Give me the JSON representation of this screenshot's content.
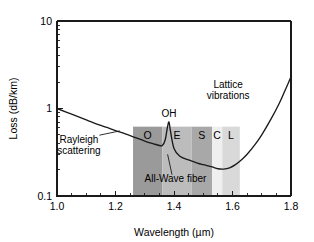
{
  "figure": {
    "background_color": "#ffffff",
    "axis_color": "#1a1a1a",
    "curve_color": "#1a1a1a"
  },
  "chart_data": {
    "type": "line",
    "title": "",
    "xlabel": "Wavelength (µm)",
    "ylabel": "Loss (dB/km)",
    "xlim": [
      1.0,
      1.8
    ],
    "ylim": [
      0.1,
      10
    ],
    "yscale": "log",
    "xscale": "linear",
    "grid": false,
    "legend": "none",
    "x_ticks": [
      {
        "value": 1.0,
        "label": "1.0"
      },
      {
        "value": 1.2,
        "label": "1.2"
      },
      {
        "value": 1.4,
        "label": "1.4"
      },
      {
        "value": 1.6,
        "label": "1.6"
      },
      {
        "value": 1.8,
        "label": "1.8"
      }
    ],
    "x_minor_ticks": [
      1.05,
      1.1,
      1.15,
      1.25,
      1.3,
      1.35,
      1.45,
      1.5,
      1.55,
      1.65,
      1.7,
      1.75
    ],
    "y_ticks": [
      {
        "value": 10,
        "label": "10"
      },
      {
        "value": 1,
        "label": "1"
      },
      {
        "value": 0.1,
        "label": "0.1"
      }
    ],
    "y_minor_ticks": [
      0.2,
      0.3,
      0.4,
      0.5,
      0.6,
      0.7,
      0.8,
      0.9,
      2,
      3,
      4,
      5,
      6,
      7,
      8,
      9
    ],
    "series": [
      {
        "name": "Fiber attenuation",
        "points": [
          [
            1.0,
            1.0
          ],
          [
            1.05,
            0.86
          ],
          [
            1.1,
            0.74
          ],
          [
            1.15,
            0.64
          ],
          [
            1.2,
            0.56
          ],
          [
            1.25,
            0.49
          ],
          [
            1.3,
            0.425
          ],
          [
            1.33,
            0.395
          ],
          [
            1.35,
            0.378
          ],
          [
            1.36,
            0.378
          ],
          [
            1.37,
            0.44
          ],
          [
            1.378,
            0.62
          ],
          [
            1.383,
            0.7
          ],
          [
            1.388,
            0.55
          ],
          [
            1.4,
            0.35
          ],
          [
            1.42,
            0.285
          ],
          [
            1.45,
            0.258
          ],
          [
            1.48,
            0.238
          ],
          [
            1.5,
            0.228
          ],
          [
            1.53,
            0.215
          ],
          [
            1.55,
            0.205
          ],
          [
            1.57,
            0.203
          ],
          [
            1.59,
            0.21
          ],
          [
            1.61,
            0.228
          ],
          [
            1.63,
            0.258
          ],
          [
            1.65,
            0.3
          ],
          [
            1.68,
            0.4
          ],
          [
            1.7,
            0.5
          ],
          [
            1.73,
            0.74
          ],
          [
            1.76,
            1.15
          ],
          [
            1.78,
            1.62
          ],
          [
            1.8,
            2.3
          ]
        ]
      }
    ],
    "bands": [
      {
        "label": "O",
        "x_start": 1.26,
        "x_end": 1.36,
        "color": "#9a9a9a"
      },
      {
        "label": "E",
        "x_start": 1.36,
        "x_end": 1.46,
        "color": "#bcbcbc"
      },
      {
        "label": "S",
        "x_start": 1.46,
        "x_end": 1.53,
        "color": "#a8a8a8"
      },
      {
        "label": "C",
        "x_start": 1.53,
        "x_end": 1.565,
        "color": "#efefef"
      },
      {
        "label": "L",
        "x_start": 1.565,
        "x_end": 1.625,
        "color": "#d9d9d9"
      }
    ],
    "band_top_value": 0.62,
    "annotations": [
      {
        "name": "rayleigh-scattering",
        "lines": [
          "Rayleigh",
          "scattering"
        ],
        "x": 1.075,
        "y": 0.4
      },
      {
        "name": "lattice-vibrations",
        "lines": [
          "Lattice",
          "vibrations"
        ],
        "x": 1.585,
        "y": 1.72
      },
      {
        "name": "oh-peak",
        "lines": [
          "OH"
        ],
        "x": 1.383,
        "y": 0.8
      },
      {
        "name": "all-wave-fiber",
        "lines": [
          "All-Wave fiber"
        ],
        "x": 1.405,
        "y": 0.145
      }
    ]
  }
}
